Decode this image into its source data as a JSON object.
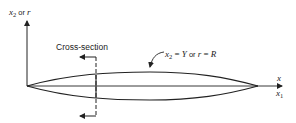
{
  "diagram": {
    "vertical_axis_label": {
      "var": "x",
      "sub": "2",
      "connector": " or ",
      "alt": "r"
    },
    "horizontal_axis_label_top": "x",
    "horizontal_axis_label_bottom": {
      "var": "x",
      "sub": "1"
    },
    "cross_section_label": "Cross-section",
    "surface_label": {
      "lhs_var": "x",
      "lhs_sub": "2",
      "eq1": " = ",
      "rhs1": "Y",
      "connector": " or ",
      "lhs2": "r",
      "eq2": " = ",
      "rhs2": "R"
    },
    "colors": {
      "ink": "#222222",
      "background": "#ffffff"
    }
  }
}
